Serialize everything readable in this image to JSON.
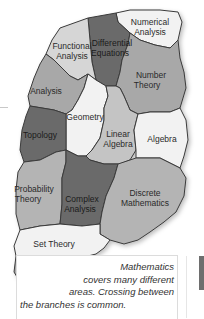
{
  "diagram": {
    "type": "map-of-mathematics",
    "regions": [
      {
        "id": "numerical-analysis",
        "label_lines": [
          "Numerical",
          "Analysis"
        ],
        "shade": "#f2f2f2"
      },
      {
        "id": "functional-analysis",
        "label_lines": [
          "Functional",
          "Analysis"
        ],
        "shade": "#d6d6d6"
      },
      {
        "id": "differential-equations",
        "label_lines": [
          "Differential",
          "Equations"
        ],
        "shade": "#6a6a6a"
      },
      {
        "id": "number-theory",
        "label_lines": [
          "Number",
          "Theory"
        ],
        "shade": "#a8a8a8"
      },
      {
        "id": "analysis",
        "label_lines": [
          "Analysis"
        ],
        "shade": "#a8a8a8"
      },
      {
        "id": "geometry",
        "label_lines": [
          "Geometry"
        ],
        "shade": "#f2f2f2"
      },
      {
        "id": "topology",
        "label_lines": [
          "Topology"
        ],
        "shade": "#6a6a6a"
      },
      {
        "id": "linear-algebra",
        "label_lines": [
          "Linear",
          "Algebra"
        ],
        "shade": "#c4c4c4"
      },
      {
        "id": "algebra",
        "label_lines": [
          "Algebra"
        ],
        "shade": "#f2f2f2"
      },
      {
        "id": "probability-theory",
        "label_lines": [
          "Probability",
          "Theory"
        ],
        "shade": "#b4b4b4"
      },
      {
        "id": "complex-analysis",
        "label_lines": [
          "Complex",
          "Analysis"
        ],
        "shade": "#6a6a6a"
      },
      {
        "id": "discrete-mathematics",
        "label_lines": [
          "Discrete",
          "Mathematics"
        ],
        "shade": "#b4b4b4"
      },
      {
        "id": "set-theory",
        "label_lines": [
          "Set Theory"
        ],
        "shade": "#f2f2f2"
      },
      {
        "id": "logic",
        "label_lines": [
          "Logic"
        ],
        "shade": "#a8a8a8"
      }
    ]
  },
  "labels": {
    "numerical_1": "Numerical",
    "numerical_2": "Analysis",
    "functional_1": "Functional",
    "functional_2": "Analysis",
    "differential_1": "Differential",
    "differential_2": "Equations",
    "number_1": "Number",
    "number_2": "Theory",
    "analysis": "Analysis",
    "geometry": "Geometry",
    "topology": "Topology",
    "linear_1": "Linear",
    "linear_2": "Algebra",
    "algebra": "Algebra",
    "probability_1": "Probability",
    "probability_2": "Theory",
    "complex_1": "Complex",
    "complex_2": "Analysis",
    "discrete_1": "Discrete",
    "discrete_2": "Mathematics",
    "set_theory": "Set Theory",
    "logic": "Logic"
  },
  "caption": {
    "line1": "Mathematics",
    "line2": "covers many different",
    "line3": "areas. Crossing between",
    "line4": "the branches is common."
  }
}
